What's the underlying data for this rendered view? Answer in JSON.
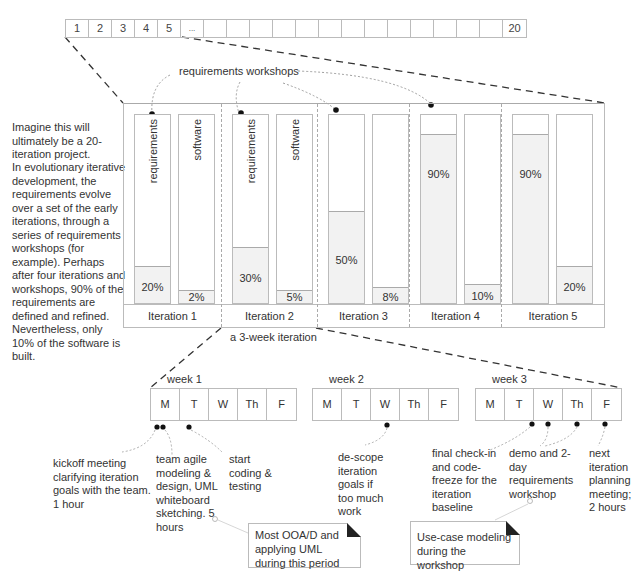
{
  "ruler": {
    "cells": [
      "1",
      "2",
      "3",
      "4",
      "5",
      "...",
      "",
      "",
      "",
      "",
      "",
      "",
      "",
      "",
      "",
      "",
      "",
      "",
      "",
      "20"
    ]
  },
  "intro_text": {
    "para1": "Imagine this will ultimately be a 20-iteration project.",
    "para2": "In evolutionary iterative development, the requirements evolve over a set of the early iterations, through a series of requirements workshops (for example). Perhaps after four iterations and workshops, 90% of the requirements are defined and refined. Nevertheless, only 10% of the software is built."
  },
  "workshops_label": "requirements workshops",
  "iteration_caption": "a 3-week iteration",
  "chart_data": {
    "type": "bar",
    "categories": [
      "Iteration 1",
      "Iteration 2",
      "Iteration 3",
      "Iteration 4",
      "Iteration 5"
    ],
    "series": [
      {
        "name": "requirements",
        "values": [
          20,
          30,
          50,
          90,
          90
        ]
      },
      {
        "name": "software",
        "values": [
          2,
          5,
          8,
          10,
          20
        ]
      }
    ],
    "value_labels": {
      "requirements": [
        "20%",
        "30%",
        "50%",
        "90%",
        "90%"
      ],
      "software": [
        "2%",
        "5%",
        "8%",
        "10%",
        "20%"
      ]
    },
    "bar_labels": {
      "requirements": "requirements",
      "software": "software"
    },
    "ylim": [
      0,
      100
    ]
  },
  "weeks": [
    {
      "label": "week 1",
      "days": [
        "M",
        "T",
        "W",
        "Th",
        "F"
      ]
    },
    {
      "label": "week 2",
      "days": [
        "M",
        "T",
        "W",
        "Th",
        "F"
      ]
    },
    {
      "label": "week 3",
      "days": [
        "M",
        "T",
        "W",
        "Th",
        "F"
      ]
    }
  ],
  "annotations": {
    "kickoff": "kickoff meeting clarifying iteration goals with the team. 1 hour",
    "modeling": "team agile modeling & design, UML whiteboard sketching. 5 hours",
    "coding": "start coding & testing",
    "descope": "de-scope iteration goals if too much work",
    "freeze": "final check-in and code-freeze for the iteration baseline",
    "demo": "demo and 2-day requirements workshop",
    "planning": "next iteration planning meeting; 2 hours"
  },
  "notes": {
    "ooad": "Most OOA/D and applying UML during this period",
    "usecase": "Use-case modeling during the workshop"
  }
}
